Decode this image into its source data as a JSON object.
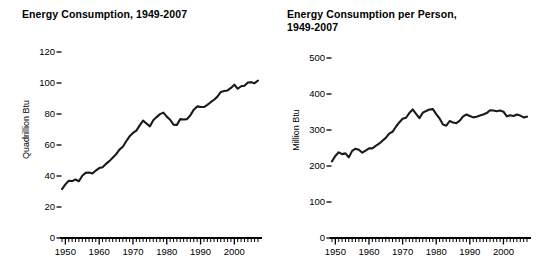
{
  "page": {
    "background": "#ffffff",
    "ink_color": "#1a1a1a"
  },
  "figures": [
    {
      "id": "energy-consumption",
      "title": "Energy Consumption, 1949-2007"
    },
    {
      "id": "energy-consumption-per-person",
      "title": "Energy Consumption per Person,\n1949-2007"
    }
  ],
  "chart_data": [
    {
      "type": "line",
      "title": "Energy Consumption, 1949-2007",
      "xlabel": "",
      "ylabel": "Quadrillion Btu",
      "xlim": [
        1949,
        2007
      ],
      "ylim": [
        0,
        130
      ],
      "grid": false,
      "legend": "none",
      "xticks": [
        1950,
        1960,
        1970,
        1980,
        1990,
        2000
      ],
      "xtick_labels": [
        "1950",
        "1960",
        "1970",
        "1980",
        "1990",
        "2000"
      ],
      "xminor_tick_interval": 1,
      "yticks": [
        0,
        20,
        40,
        60,
        80,
        100,
        120
      ],
      "ytick_labels": [
        "0",
        "20",
        "40",
        "60",
        "80",
        "100",
        "120"
      ],
      "x": [
        1949,
        1950,
        1951,
        1952,
        1953,
        1954,
        1955,
        1956,
        1957,
        1958,
        1959,
        1960,
        1961,
        1962,
        1963,
        1964,
        1965,
        1966,
        1967,
        1968,
        1969,
        1970,
        1971,
        1972,
        1973,
        1974,
        1975,
        1976,
        1977,
        1978,
        1979,
        1980,
        1981,
        1982,
        1983,
        1984,
        1985,
        1986,
        1987,
        1988,
        1989,
        1990,
        1991,
        1992,
        1993,
        1994,
        1995,
        1996,
        1997,
        1998,
        1999,
        2000,
        2001,
        2002,
        2003,
        2004,
        2005,
        2006,
        2007
      ],
      "values": [
        31.6,
        34.6,
        36.9,
        36.7,
        37.7,
        36.6,
        40.2,
        42.0,
        42.3,
        41.6,
        43.5,
        45.1,
        45.7,
        47.8,
        49.6,
        51.8,
        54.0,
        57.0,
        58.9,
        62.4,
        65.6,
        67.8,
        69.3,
        72.7,
        75.7,
        73.9,
        72.0,
        76.0,
        78.0,
        79.9,
        80.9,
        78.3,
        76.3,
        73.1,
        73.0,
        76.7,
        76.4,
        76.7,
        79.2,
        82.8,
        84.9,
        84.6,
        84.5,
        85.9,
        87.6,
        89.2,
        91.2,
        94.2,
        94.8,
        95.2,
        96.8,
        98.9,
        96.3,
        97.9,
        98.2,
        100.3,
        100.5,
        99.9,
        101.6
      ]
    },
    {
      "type": "line",
      "title": "Energy Consumption per Person, 1949-2007",
      "xlabel": "",
      "ylabel": "Million Btu",
      "xlim": [
        1949,
        2007
      ],
      "ylim": [
        0,
        540
      ],
      "grid": false,
      "legend": "none",
      "xticks": [
        1950,
        1960,
        1970,
        1980,
        1990,
        2000
      ],
      "xtick_labels": [
        "1950",
        "1960",
        "1970",
        "1980",
        "1990",
        "2000"
      ],
      "xminor_tick_interval": 1,
      "yticks": [
        0,
        100,
        200,
        300,
        400,
        500
      ],
      "ytick_labels": [
        "0",
        "100",
        "200",
        "300",
        "400",
        "500"
      ],
      "x": [
        1949,
        1950,
        1951,
        1952,
        1953,
        1954,
        1955,
        1956,
        1957,
        1958,
        1959,
        1960,
        1961,
        1962,
        1963,
        1964,
        1965,
        1966,
        1967,
        1968,
        1969,
        1970,
        1971,
        1972,
        1973,
        1974,
        1975,
        1976,
        1977,
        1978,
        1979,
        1980,
        1981,
        1982,
        1983,
        1984,
        1985,
        1986,
        1987,
        1988,
        1989,
        1990,
        1991,
        1992,
        1993,
        1994,
        1995,
        1996,
        1997,
        1998,
        1999,
        2000,
        2001,
        2002,
        2003,
        2004,
        2005,
        2006,
        2007
      ],
      "values": [
        213,
        228,
        238,
        233,
        235,
        224,
        242,
        248,
        245,
        237,
        243,
        249,
        249,
        256,
        262,
        270,
        278,
        290,
        295,
        309,
        321,
        331,
        334,
        347,
        357,
        345,
        333,
        348,
        353,
        357,
        358,
        344,
        332,
        315,
        312,
        325,
        321,
        319,
        326,
        338,
        343,
        339,
        335,
        337,
        340,
        343,
        347,
        355,
        354,
        352,
        354,
        351,
        338,
        341,
        339,
        343,
        340,
        335,
        337
      ]
    }
  ]
}
